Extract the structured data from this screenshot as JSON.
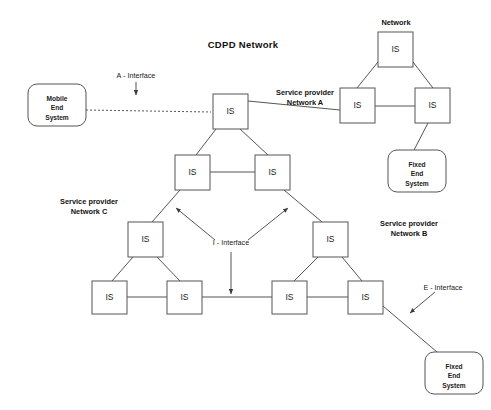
{
  "diagram": {
    "title": "CDPD  Network",
    "type": "network-topology",
    "canvas": {
      "width": 491,
      "height": 410
    },
    "colors": {
      "stroke": "#555555",
      "text": "#1a1a1a",
      "background": "#ffffff"
    }
  },
  "group_labels": {
    "network_top": "Network",
    "network_a_line1": "Service provider",
    "network_a_line2": "Network A",
    "network_b_line1": "Service provider",
    "network_b_line2": "Network B",
    "network_c_line1": "Service provider",
    "network_c_line2": "Network C"
  },
  "interfaces": [
    {
      "id": "a-interface",
      "label": "A - Interface"
    },
    {
      "id": "i-interface",
      "label": "I - Interface"
    },
    {
      "id": "e-interface",
      "label": "E  - Interface"
    }
  ],
  "nodes": [
    {
      "id": "is-net-top",
      "label": "IS",
      "x": 378,
      "y": 32,
      "w": 35,
      "h": 35
    },
    {
      "id": "is-net-left",
      "label": "IS",
      "x": 340,
      "y": 88,
      "w": 35,
      "h": 35
    },
    {
      "id": "is-net-right",
      "label": "IS",
      "x": 415,
      "y": 88,
      "w": 35,
      "h": 35
    },
    {
      "id": "is-a-top",
      "label": "IS",
      "x": 213,
      "y": 94,
      "w": 35,
      "h": 35
    },
    {
      "id": "is-mid-left",
      "label": "IS",
      "x": 175,
      "y": 155,
      "w": 35,
      "h": 35
    },
    {
      "id": "is-mid-right",
      "label": "IS",
      "x": 255,
      "y": 155,
      "w": 35,
      "h": 35
    },
    {
      "id": "is-c-top",
      "label": "IS",
      "x": 128,
      "y": 222,
      "w": 35,
      "h": 35
    },
    {
      "id": "is-c-left",
      "label": "IS",
      "x": 92,
      "y": 281,
      "w": 35,
      "h": 33
    },
    {
      "id": "is-c-right",
      "label": "IS",
      "x": 167,
      "y": 281,
      "w": 35,
      "h": 33
    },
    {
      "id": "is-b-top",
      "label": "IS",
      "x": 313,
      "y": 222,
      "w": 35,
      "h": 35
    },
    {
      "id": "is-b-left",
      "label": "IS",
      "x": 272,
      "y": 281,
      "w": 35,
      "h": 33
    },
    {
      "id": "is-b-right",
      "label": "IS",
      "x": 348,
      "y": 281,
      "w": 35,
      "h": 33
    }
  ],
  "end_systems": [
    {
      "id": "mobile-end-system",
      "lines": [
        "Mobile",
        "End",
        "System"
      ],
      "x": 28,
      "y": 84,
      "w": 58,
      "h": 42,
      "r": 9
    },
    {
      "id": "fixed-end-system-a",
      "lines": [
        "Fixed",
        "End",
        "System"
      ],
      "x": 388,
      "y": 150,
      "w": 58,
      "h": 42,
      "r": 9
    },
    {
      "id": "fixed-end-system-b",
      "lines": [
        "Fixed",
        "End",
        "System"
      ],
      "x": 425,
      "y": 352,
      "w": 58,
      "h": 42,
      "r": 9
    }
  ],
  "links": [
    {
      "id": "link-net-top-left",
      "x1": 378,
      "y1": 62,
      "x2": 357,
      "y2": 88,
      "style": "solid"
    },
    {
      "id": "link-net-top-right",
      "x1": 413,
      "y1": 62,
      "x2": 433,
      "y2": 88,
      "style": "solid"
    },
    {
      "id": "link-net-left-right",
      "x1": 375,
      "y1": 106,
      "x2": 415,
      "y2": 106,
      "style": "solid"
    },
    {
      "id": "link-net-left-a-top",
      "x1": 340,
      "y1": 110,
      "x2": 248,
      "y2": 101,
      "style": "solid"
    },
    {
      "id": "link-net-right-fixed",
      "x1": 428,
      "y1": 123,
      "x2": 414,
      "y2": 150,
      "style": "solid"
    },
    {
      "id": "link-a-top-mid-left",
      "x1": 216,
      "y1": 129,
      "x2": 196,
      "y2": 155,
      "style": "solid"
    },
    {
      "id": "link-a-top-mid-right",
      "x1": 240,
      "y1": 129,
      "x2": 268,
      "y2": 155,
      "style": "solid"
    },
    {
      "id": "link-mid-left-right",
      "x1": 210,
      "y1": 172,
      "x2": 255,
      "y2": 172,
      "style": "solid"
    },
    {
      "id": "link-mid-left-c-top",
      "x1": 180,
      "y1": 190,
      "x2": 152,
      "y2": 222,
      "style": "solid"
    },
    {
      "id": "link-mid-right-b-top",
      "x1": 284,
      "y1": 190,
      "x2": 322,
      "y2": 222,
      "style": "solid"
    },
    {
      "id": "link-c-top-c-left",
      "x1": 133,
      "y1": 257,
      "x2": 112,
      "y2": 281,
      "style": "solid"
    },
    {
      "id": "link-c-top-c-right",
      "x1": 157,
      "y1": 257,
      "x2": 180,
      "y2": 281,
      "style": "solid"
    },
    {
      "id": "link-c-left-c-right",
      "x1": 127,
      "y1": 297,
      "x2": 167,
      "y2": 297,
      "style": "solid"
    },
    {
      "id": "link-c-right-b-left",
      "x1": 202,
      "y1": 297,
      "x2": 272,
      "y2": 297,
      "style": "solid"
    },
    {
      "id": "link-b-top-b-left",
      "x1": 318,
      "y1": 257,
      "x2": 294,
      "y2": 281,
      "style": "solid"
    },
    {
      "id": "link-b-top-b-right",
      "x1": 342,
      "y1": 257,
      "x2": 362,
      "y2": 281,
      "style": "solid"
    },
    {
      "id": "link-b-left-b-right",
      "x1": 307,
      "y1": 297,
      "x2": 348,
      "y2": 297,
      "style": "solid"
    },
    {
      "id": "link-b-right-fixed",
      "x1": 383,
      "y1": 306,
      "x2": 437,
      "y2": 352,
      "style": "solid"
    },
    {
      "id": "link-mobile-a-top",
      "x1": 86,
      "y1": 110,
      "x2": 211,
      "y2": 112,
      "style": "dashed"
    }
  ],
  "annotations": [
    {
      "id": "a-iface-arrow",
      "x1": 136,
      "y1": 82,
      "x2": 136,
      "y2": 95
    },
    {
      "id": "i-iface-arrow-down",
      "x1": 231,
      "y1": 252,
      "x2": 231,
      "y2": 294
    },
    {
      "id": "i-iface-arrow-upleft",
      "x1": 215,
      "y1": 240,
      "x2": 176,
      "y2": 208
    },
    {
      "id": "i-iface-arrow-upright",
      "x1": 248,
      "y1": 240,
      "x2": 288,
      "y2": 208
    },
    {
      "id": "e-iface-arrow",
      "x1": 435,
      "y1": 292,
      "x2": 410,
      "y2": 313
    }
  ],
  "label_positions": {
    "title": {
      "x": 243,
      "y": 48
    },
    "network_top": {
      "x": 396,
      "y": 25
    },
    "network_a": {
      "x": 305,
      "y": 95
    },
    "network_b": {
      "x": 409,
      "y": 226
    },
    "network_c": {
      "x": 89,
      "y": 204
    },
    "a_interface": {
      "x": 136,
      "y": 78
    },
    "i_interface": {
      "x": 231,
      "y": 245
    },
    "e_interface": {
      "x": 443,
      "y": 290
    }
  }
}
